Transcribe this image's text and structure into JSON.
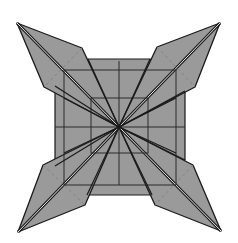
{
  "diagram": {
    "colors": {
      "fill": "#9a9a9a",
      "stroke": "#1a1a1a",
      "grid": "#2a2a2a",
      "highlight": "#e8e8e8",
      "background": "#ffffff"
    },
    "center": [
      119,
      127
    ],
    "outer_square": {
      "top": [
        [
          88,
          59
        ],
        [
          150,
          59
        ]
      ],
      "left": [
        [
          55,
          86
        ],
        [
          55,
          166
        ]
      ],
      "right": [
        [
          185,
          91
        ],
        [
          185,
          160
        ]
      ],
      "bottom": [
        [
          87,
          195
        ],
        [
          152,
          195
        ]
      ]
    },
    "inner_square": {
      "x1": 91,
      "y1": 98,
      "x2": 148,
      "y2": 153
    },
    "mid_square": {
      "x1": 64,
      "y1": 70,
      "x2": 176,
      "y2": 185
    },
    "points": [
      {
        "name": "top-left",
        "tip": [
          17,
          23
        ],
        "side_a": [
          82,
          48
        ],
        "side_b": [
          44,
          87
        ]
      },
      {
        "name": "top-right",
        "tip": [
          220,
          23
        ],
        "side_a": [
          157,
          47
        ],
        "side_b": [
          195,
          87
        ]
      },
      {
        "name": "bottom-left",
        "tip": [
          18,
          232
        ],
        "side_a": [
          43,
          165
        ],
        "side_b": [
          85,
          205
        ]
      },
      {
        "name": "bottom-right",
        "tip": [
          221,
          231
        ],
        "side_a": [
          193,
          165
        ],
        "side_b": [
          155,
          205
        ]
      }
    ]
  }
}
